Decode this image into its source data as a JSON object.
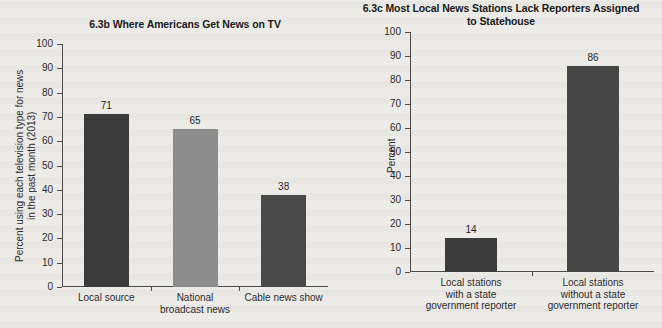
{
  "background_color": "#ecebe8",
  "figures": [
    {
      "id": "6.3b",
      "title": "6.3b Where Americans Get News on TV",
      "ylabel": "Percent using each television type for news\nin the past month (2013)"
    },
    {
      "id": "6.3c",
      "title": "6.3c Most Local News Stations Lack Reporters\nAssigned to Statehouse",
      "ylabel": "Percent"
    }
  ],
  "chart_data": [
    {
      "type": "bar",
      "title": "6.3b Where Americans Get News on TV",
      "xlabel": "",
      "ylabel": "Percent using each television type for news in the past month (2013)",
      "ylim": [
        0,
        100
      ],
      "yticks": [
        0,
        10,
        20,
        30,
        40,
        50,
        60,
        70,
        80,
        90,
        100
      ],
      "ytick_labels": [
        "0",
        "10",
        "20",
        "30",
        "40",
        "50",
        "60",
        "70",
        "80",
        "90",
        "100"
      ],
      "categories": [
        "Local source",
        "National\nbroadcast news",
        "Cable news show"
      ],
      "values": [
        71,
        65,
        38
      ],
      "value_labels": [
        "71",
        "65",
        "38"
      ],
      "bar_colors": [
        "#3b3b3b",
        "#8d8d8d",
        "#4a4a4a"
      ],
      "grid": false,
      "legend": "none"
    },
    {
      "type": "bar",
      "title": "6.3c Most Local News Stations Lack Reporters Assigned to Statehouse",
      "xlabel": "",
      "ylabel": "Percent",
      "ylim": [
        0,
        100
      ],
      "yticks": [
        0,
        10,
        20,
        30,
        40,
        50,
        60,
        70,
        80,
        90,
        100
      ],
      "ytick_labels": [
        "0",
        "10",
        "20",
        "30",
        "40",
        "50",
        "60",
        "70",
        "80",
        "90",
        "100"
      ],
      "categories": [
        "Local stations\nwith a state\ngovernment reporter",
        "Local stations\nwithout a state\ngovernment reporter"
      ],
      "values": [
        14,
        86
      ],
      "value_labels": [
        "14",
        "86"
      ],
      "bar_colors": [
        "#3b3b3b",
        "#464646"
      ],
      "grid": false,
      "legend": "none"
    }
  ]
}
